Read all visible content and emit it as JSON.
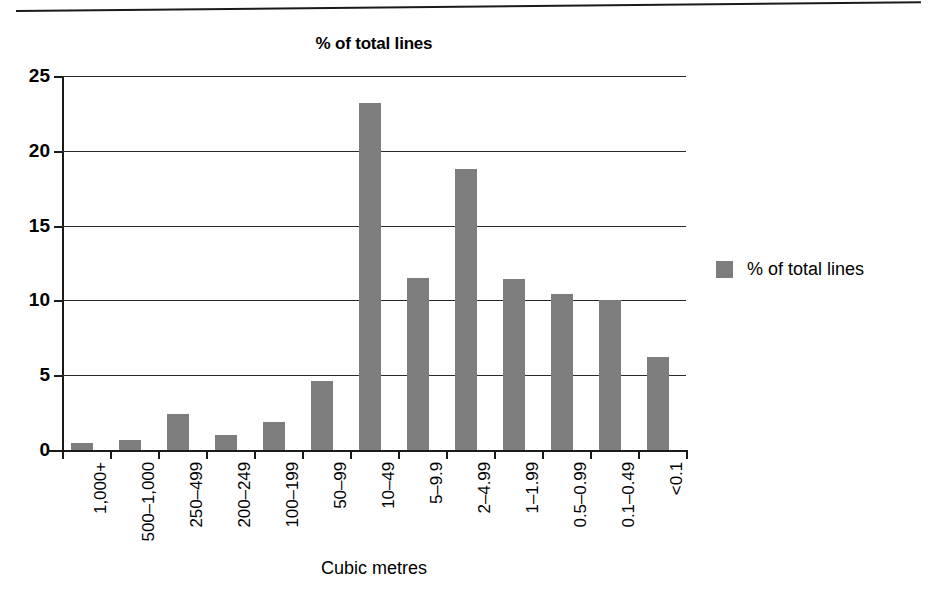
{
  "chart_data": {
    "type": "bar",
    "title": "% of total lines",
    "xlabel": "Cubic metres",
    "ylabel": "",
    "ylim": [
      0,
      25
    ],
    "yticks": [
      0,
      5,
      10,
      15,
      20,
      25
    ],
    "ytick_labels": [
      "0",
      "5",
      "10",
      "15",
      "20",
      "25"
    ],
    "grid": true,
    "legend_position": "right",
    "legend": [
      "% of total lines"
    ],
    "categories": [
      "1,000+",
      "500–1,000",
      "250–499",
      "200–249",
      "100–199",
      "50–99",
      "10–49",
      "5–9.9",
      "2–4.99",
      "1–1.99",
      "0.5–0.99",
      "0.1–0.49",
      "<0.1"
    ],
    "series": [
      {
        "name": "% of total lines",
        "values": [
          0.5,
          0.7,
          2.4,
          1.0,
          1.9,
          4.6,
          23.2,
          11.5,
          18.8,
          11.4,
          10.4,
          10.0,
          6.2
        ]
      }
    ],
    "bar_color": "#7d7d7d",
    "axis_color": "#1a1a1a",
    "background_color": "#ffffff"
  },
  "legend": {
    "swatch_color": "#7d7d7d",
    "label": "% of total lines"
  }
}
